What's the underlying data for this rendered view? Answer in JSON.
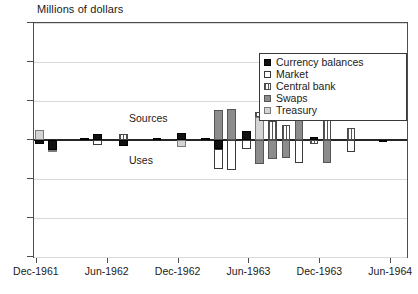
{
  "chart_data": {
    "type": "bar",
    "title": "Millions of dollars",
    "xlabel": "",
    "ylabel": "Millions of dollars",
    "ylim": [
      -300,
      300
    ],
    "yticks": [
      300,
      200,
      100,
      0,
      -100,
      -200,
      -300
    ],
    "grid": true,
    "stacked": true,
    "orientation": "vertical",
    "legend_position": "top-right",
    "annotations": [
      {
        "text": "Sources",
        "x": "Sep-1962",
        "y": 55
      },
      {
        "text": "Uses",
        "x": "Sep-1962",
        "y": -55
      }
    ],
    "xticks": [
      "Dec-1961",
      "Jun-1962",
      "Dec-1962",
      "Jun-1963",
      "Dec-1963",
      "Jun-1964"
    ],
    "xtick_positions_pct": [
      0.5,
      19.5,
      38.5,
      57.5,
      76.5,
      95.5
    ],
    "categories": [
      "Dec-1961",
      "Jan-1962",
      "Feb-1962",
      "Mar-1962",
      "Apr-1962",
      "May-1962",
      "Jun-1962",
      "Jul-1962",
      "Aug-1962",
      "Sep-1962",
      "Oct-1962",
      "Nov-1962",
      "Dec-1962",
      "Jan-1963",
      "Feb-1963",
      "Mar-1963",
      "Apr-1963",
      "May-1963",
      "Jun-1963",
      "Jul-1963",
      "Aug-1963",
      "Sep-1963",
      "Oct-1963",
      "Nov-1963",
      "Dec-1963",
      "Jan-1964",
      "Feb-1964",
      "Mar-1964",
      "Apr-1964",
      "May-1964",
      "Jun-1964",
      "Jul-1964"
    ],
    "series": [
      {
        "name": "Currency balances",
        "pattern": "solid-black",
        "color": "#111111",
        "values": [
          -22,
          0,
          0,
          0,
          0,
          0,
          12,
          0,
          0,
          14,
          0,
          0,
          0,
          18,
          0,
          0,
          22,
          0,
          -18,
          0,
          0,
          -8,
          0,
          0,
          -6,
          0,
          0,
          0,
          0,
          0,
          5,
          0
        ]
      },
      {
        "name": "Market",
        "pattern": "open-white",
        "color": "#ffffff",
        "values": [
          0,
          0,
          0,
          0,
          0,
          0,
          -14,
          0,
          0,
          -18,
          0,
          0,
          0,
          -62,
          0,
          0,
          -68,
          0,
          -35,
          0,
          0,
          -42,
          0,
          0,
          -58,
          0,
          0,
          0,
          0,
          0,
          -30,
          0
        ]
      },
      {
        "name": "Central bank",
        "pattern": "vertical-stripes",
        "color": "#ffffff",
        "values": [
          0,
          0,
          0,
          0,
          0,
          0,
          0,
          0,
          0,
          20,
          0,
          0,
          0,
          0,
          0,
          0,
          0,
          0,
          42,
          0,
          0,
          38,
          0,
          0,
          62,
          0,
          0,
          0,
          0,
          0,
          30,
          0
        ]
      },
      {
        "name": "Swaps",
        "pattern": "solid-gray",
        "color": "#8c8c8c",
        "values": [
          0,
          0,
          0,
          0,
          0,
          0,
          0,
          0,
          0,
          0,
          0,
          0,
          0,
          72,
          0,
          0,
          75,
          0,
          -58,
          0,
          0,
          -48,
          0,
          0,
          -60,
          0,
          0,
          0,
          0,
          0,
          0,
          0
        ]
      },
      {
        "name": "Treasury",
        "pattern": "light-gray",
        "color": "#d4d4d4",
        "values": [
          28,
          0,
          0,
          0,
          0,
          0,
          0,
          0,
          0,
          0,
          0,
          0,
          0,
          0,
          0,
          0,
          0,
          0,
          55,
          0,
          0,
          48,
          0,
          0,
          0,
          0,
          0,
          0,
          0,
          0,
          0,
          0
        ]
      }
    ],
    "bars": [
      {
        "index": 0,
        "x_pct": 1.5,
        "pos": [
          {
            "s": "Treasury",
            "v": 26
          }
        ],
        "neg": [
          {
            "s": "Currency balances",
            "v": -10
          }
        ]
      },
      {
        "index": 1,
        "x_pct": 5.0,
        "pos": [],
        "neg": [
          {
            "s": "Currency balances",
            "v": -26
          },
          {
            "s": "Treasury",
            "v": -6
          }
        ]
      },
      {
        "index": 2,
        "x_pct": 13.5,
        "pos": [
          {
            "s": "Currency balances",
            "v": 5
          }
        ],
        "neg": []
      },
      {
        "index": 3,
        "x_pct": 17.0,
        "pos": [
          {
            "s": "Currency balances",
            "v": 16
          }
        ],
        "neg": [
          {
            "s": "Market",
            "v": -14
          }
        ]
      },
      {
        "index": 4,
        "x_pct": 24.0,
        "pos": [
          {
            "s": "Central bank",
            "v": 16
          }
        ],
        "neg": [
          {
            "s": "Currency balances",
            "v": -16
          }
        ]
      },
      {
        "index": 5,
        "x_pct": 33.0,
        "pos": [
          {
            "s": "Currency balances",
            "v": 4
          }
        ],
        "neg": []
      },
      {
        "index": 6,
        "x_pct": 39.5,
        "pos": [
          {
            "s": "Currency balances",
            "v": 18
          }
        ],
        "neg": [
          {
            "s": "Treasury",
            "v": -18
          }
        ]
      },
      {
        "index": 7,
        "x_pct": 46.0,
        "pos": [
          {
            "s": "Currency balances",
            "v": 5
          }
        ],
        "neg": []
      },
      {
        "index": 8,
        "x_pct": 49.5,
        "pos": [
          {
            "s": "Swaps",
            "v": 78
          }
        ],
        "neg": [
          {
            "s": "Currency balances",
            "v": -22
          },
          {
            "s": "Market",
            "v": -52
          }
        ]
      },
      {
        "index": 9,
        "x_pct": 53.0,
        "pos": [
          {
            "s": "Swaps",
            "v": 80
          }
        ],
        "neg": [
          {
            "s": "Market",
            "v": -76
          }
        ]
      },
      {
        "index": 10,
        "x_pct": 57.0,
        "pos": [
          {
            "s": "Currency balances",
            "v": 22
          }
        ],
        "neg": [
          {
            "s": "Market",
            "v": -22
          }
        ]
      },
      {
        "index": 11,
        "x_pct": 60.5,
        "pos": [
          {
            "s": "Treasury",
            "v": 60
          },
          {
            "s": "Central bank",
            "v": 12
          }
        ],
        "neg": [
          {
            "s": "Swaps",
            "v": -62
          }
        ]
      },
      {
        "index": 12,
        "x_pct": 64.0,
        "pos": [
          {
            "s": "Central bank",
            "v": 48
          }
        ],
        "neg": [
          {
            "s": "Swaps",
            "v": -48
          }
        ]
      },
      {
        "index": 13,
        "x_pct": 67.5,
        "pos": [
          {
            "s": "Central bank",
            "v": 38
          }
        ],
        "neg": [
          {
            "s": "Swaps",
            "v": -45
          }
        ]
      },
      {
        "index": 14,
        "x_pct": 71.0,
        "pos": [
          {
            "s": "Swaps",
            "v": 62
          }
        ],
        "neg": [
          {
            "s": "Market",
            "v": -58
          }
        ]
      },
      {
        "index": 15,
        "x_pct": 75.0,
        "pos": [
          {
            "s": "Currency balances",
            "v": 8
          }
        ],
        "neg": [
          {
            "s": "Central bank",
            "v": -10
          }
        ]
      },
      {
        "index": 16,
        "x_pct": 78.5,
        "pos": [
          {
            "s": "Central bank",
            "v": 62
          }
        ],
        "neg": [
          {
            "s": "Swaps",
            "v": -60
          }
        ]
      },
      {
        "index": 17,
        "x_pct": 85.0,
        "pos": [
          {
            "s": "Central bank",
            "v": 30
          }
        ],
        "neg": [
          {
            "s": "Market",
            "v": -30
          }
        ]
      },
      {
        "index": 18,
        "x_pct": 93.5,
        "pos": [],
        "neg": [
          {
            "s": "Currency balances",
            "v": -5
          }
        ]
      }
    ]
  },
  "legend": {
    "items": [
      {
        "label": "Currency balances",
        "pattern": "pat-currency"
      },
      {
        "label": "Market",
        "pattern": "pat-market"
      },
      {
        "label": "Central bank",
        "pattern": "pat-central"
      },
      {
        "label": "Swaps",
        "pattern": "pat-swaps"
      },
      {
        "label": "Treasury",
        "pattern": "pat-treasury"
      }
    ]
  }
}
